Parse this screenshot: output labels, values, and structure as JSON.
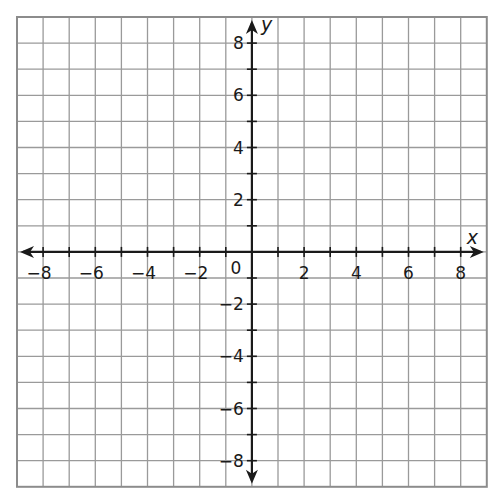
{
  "chart_data": {
    "type": "coordinate-grid",
    "title": "",
    "xlabel": "x",
    "ylabel": "y",
    "xlim": [
      -9,
      9
    ],
    "ylim": [
      -9,
      9
    ],
    "grid": true,
    "grid_step": 1,
    "x_ticks": [
      -8,
      -6,
      -4,
      -2,
      2,
      4,
      6,
      8
    ],
    "y_ticks": [
      8,
      6,
      4,
      2,
      -2,
      -4,
      -6,
      -8
    ],
    "x_tick_labels": [
      "−8",
      "−6",
      "−4",
      "−2",
      "2",
      "4",
      "6",
      "8"
    ],
    "y_tick_labels": [
      "8",
      "6",
      "4",
      "2",
      "−2",
      "−4",
      "−6",
      "−8"
    ],
    "origin_label": "0",
    "series": [],
    "legend": null
  },
  "layout": {
    "left": 17,
    "top": 17,
    "cell": 26.1,
    "cells": 18,
    "colors": {
      "grid": "#9a9a9a",
      "border": "#8c8c8c",
      "axis": "#1a1a1a"
    }
  }
}
